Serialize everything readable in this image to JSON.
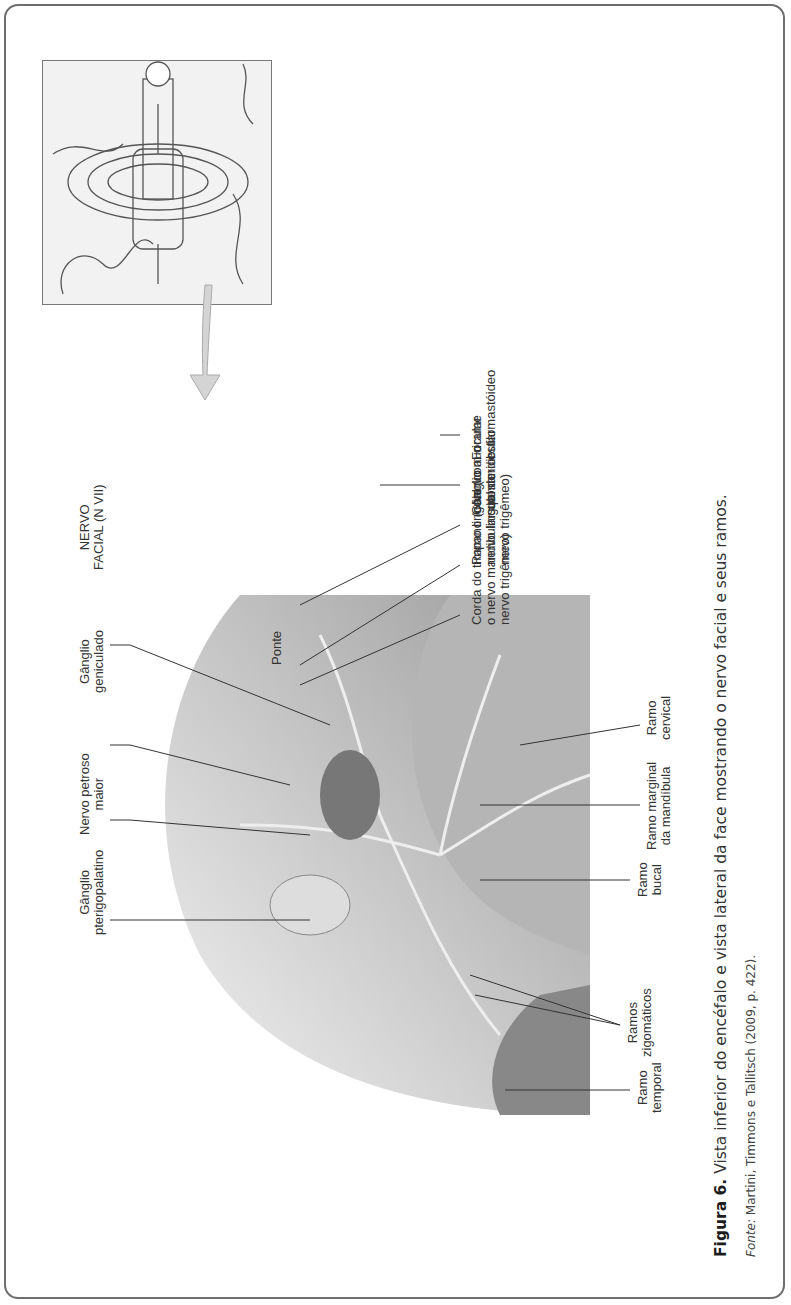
{
  "figure": {
    "caption_label": "Figura 6.",
    "caption_text": " Vista inferior do encéfalo e vista lateral da face mostrando o nervo facial e seus ramos.",
    "source_label": "Fonte:",
    "source_text": " Martini, Timmons e Tallitsch (2009, p. 422)."
  },
  "labels": {
    "ramo_temporal": [
      "Ramo",
      "temporal"
    ],
    "ramos_zigomaticos": [
      "Ramos",
      "zigomáticos"
    ],
    "ramo_bucal": [
      "Ramo",
      "bucal"
    ],
    "ramo_marginal": [
      "Ramo marginal",
      "da mandíbula"
    ],
    "ramo_cervical": [
      "Ramo",
      "cervical"
    ],
    "ganglio_pterigopalatino": [
      "Gânglio",
      "pterigopalatino"
    ],
    "nervo_petroso": [
      "Nervo petroso",
      "maior"
    ],
    "ganglio_geniculado": [
      "Gânglio",
      "geniculado"
    ],
    "nervo_facial": [
      "NERVO",
      "FACIAL (N VII)"
    ],
    "ponte": "Ponte",
    "nervo_auricular": [
      "Nervo auricular",
      "posterior"
    ],
    "forame": [
      "Forame",
      "estilomastóideo"
    ],
    "corda_timpano": [
      "Corda do tímpano (com",
      "o nervo mandibular do",
      "nervo trigêmeo)"
    ],
    "ramo_lingual": [
      "Ramo lingual (com o",
      "nervo lingual do",
      "nervo trigêmeo)"
    ],
    "ganglio_submandibular": [
      "Gânglio",
      "submandibular"
    ]
  },
  "colors": {
    "frame": "#6e6e6e",
    "illustration_shade": "#9a9a9a",
    "arrow": "#d4d4d4"
  }
}
